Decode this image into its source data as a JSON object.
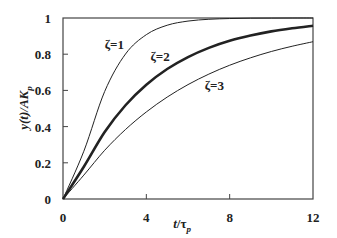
{
  "chart_data": {
    "type": "line",
    "title": "",
    "xlabel": "t/τp",
    "ylabel": "y(t)/AKp",
    "xlim": [
      0,
      12
    ],
    "ylim": [
      0,
      1
    ],
    "x_ticks": [
      "0",
      "4",
      "8",
      "12"
    ],
    "y_ticks": [
      "0",
      "0.2",
      "0.4",
      "0.6",
      "0.8",
      "1"
    ],
    "grid": false,
    "legend": "none (inline curve labels)",
    "x": [
      0,
      1,
      2,
      3,
      4,
      5,
      6,
      7,
      8,
      9,
      10,
      11,
      12
    ],
    "series": [
      {
        "name": "ζ=1",
        "label": "ζ=1",
        "width": 1,
        "values": [
          0,
          0.264,
          0.594,
          0.801,
          0.908,
          0.96,
          0.983,
          0.993,
          0.997,
          0.999,
          0.9995,
          1.0,
          1.0
        ]
      },
      {
        "name": "ζ=2",
        "label": "ζ=2",
        "width": 2.6,
        "values": [
          0,
          0.178,
          0.37,
          0.518,
          0.631,
          0.718,
          0.784,
          0.835,
          0.874,
          0.903,
          0.926,
          0.943,
          0.957
        ]
      },
      {
        "name": "ζ=3",
        "label": "ζ=3",
        "width": 1,
        "values": [
          0,
          0.132,
          0.269,
          0.384,
          0.481,
          0.563,
          0.632,
          0.69,
          0.739,
          0.78,
          0.815,
          0.844,
          0.869
        ]
      }
    ],
    "annotations": [
      {
        "text": "ζ=1",
        "x": 2.0,
        "y": 0.83
      },
      {
        "text": "ζ=2",
        "x": 4.2,
        "y": 0.76
      },
      {
        "text": "ζ=3",
        "x": 6.8,
        "y": 0.6
      }
    ]
  },
  "axis": {
    "x_label_main": "t",
    "x_label_slash": "/",
    "x_label_tau": "τ",
    "x_label_sub": "p",
    "y_label_main": "y(t)/AK",
    "y_label_sub": "p"
  }
}
